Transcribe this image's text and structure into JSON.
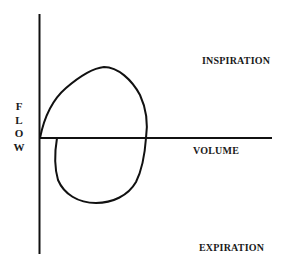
{
  "diagram": {
    "axes": {
      "y_label_letters": [
        "F",
        "L",
        "O",
        "W"
      ],
      "x_label": "VOLUME"
    },
    "regions": {
      "top_label": "INSPIRATION",
      "bottom_label": "EXPIRATION"
    },
    "colors": {
      "line": "#111111",
      "text": "#1a1a1a",
      "background": "#ffffff"
    }
  }
}
